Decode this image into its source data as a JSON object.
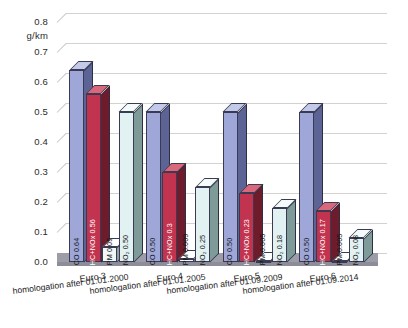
{
  "chart_data": {
    "type": "bar",
    "title": "",
    "subtitle": "",
    "xlabel": "",
    "ylabel": "g/km",
    "unit_label": "g/km",
    "ylim": [
      0.0,
      0.8
    ],
    "ytick_step": 0.1,
    "yticks": [
      "0.0",
      "0.1",
      "0.2",
      "0.3",
      "0.4",
      "0.5",
      "0.6",
      "0.7",
      "0.8"
    ],
    "grid": true,
    "legend": "none",
    "style": "3d-column",
    "categories": [
      "Euro 3",
      "Euro 4",
      "Euro 5",
      "Euro 6"
    ],
    "category_sublabels": [
      "homologation after  01.01.2000",
      "homologation after  01.01.2005",
      "homologation after  01.09.2009",
      "homologation after  01.09.2014"
    ],
    "series": [
      {
        "name": "CO",
        "values": [
          0.64,
          0.5,
          0.5,
          0.5
        ],
        "color": "#9ea7d8",
        "side_color": "#5b6494",
        "top_color": "#c3c9e8"
      },
      {
        "name": "HC+NOx",
        "values": [
          0.56,
          0.3,
          0.23,
          0.17
        ],
        "color": "#c2334f",
        "side_color": "#6e1b2c",
        "top_color": "#d9687d"
      },
      {
        "name": "PM",
        "values": [
          0.05,
          0.009,
          0.005,
          0.005
        ],
        "color": "#f0f7f7",
        "side_color": "#8f9f9f",
        "top_color": "#ffffff"
      },
      {
        "name": "NO2",
        "values": [
          0.5,
          0.25,
          0.18,
          0.08
        ],
        "color": "#e2f1f1",
        "side_color": "#7e9a99",
        "top_color": "#f4fbfb"
      }
    ],
    "data_labels": [
      [
        {
          "series": "CO",
          "text": "CO  0.64"
        },
        {
          "series": "HC+NOx",
          "text": "HC+NOx  0.56"
        },
        {
          "series": "PM",
          "text": "PM  0.05"
        },
        {
          "series": "NO2",
          "text": "NO₂  0.50"
        }
      ],
      [
        {
          "series": "CO",
          "text": "CO  0.50"
        },
        {
          "series": "HC+NOx",
          "text": "HC+NOx  0.3"
        },
        {
          "series": "PM",
          "text": "PM  0.009"
        },
        {
          "series": "NO2",
          "text": "NO₂  0.25"
        }
      ],
      [
        {
          "series": "CO",
          "text": "CO  0.50"
        },
        {
          "series": "HC+NOx",
          "text": "HC+NOx  0.23"
        },
        {
          "series": "PM",
          "text": "PM  0.005"
        },
        {
          "series": "NO2",
          "text": "NO₂  0.18"
        }
      ],
      [
        {
          "series": "CO",
          "text": "CO  0.50"
        },
        {
          "series": "HC+NOx",
          "text": "HC+NOx  0.17"
        },
        {
          "series": "PM",
          "text": "PM  0.005"
        },
        {
          "series": "NO2",
          "text": "NO₂  0.08"
        }
      ]
    ]
  }
}
